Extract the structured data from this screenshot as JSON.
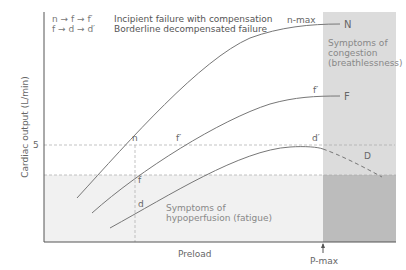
{
  "legend": {
    "items": [
      {
        "key": "n → f → f′",
        "description": "Incipient failure with compensation"
      },
      {
        "key": "f → d → d′",
        "description": "Borderline decompensated failure"
      }
    ]
  },
  "axes": {
    "y_label": "Cardiac output (L/min)",
    "y_tick": "5",
    "x_label": "Preload",
    "x_marker": "P-max"
  },
  "curves": {
    "normal": {
      "start_label": "n",
      "max_label": "n-max",
      "end_label": "N"
    },
    "failure": {
      "start_label": "f",
      "shift_label": "f′",
      "end_label": "F"
    },
    "decompensated": {
      "start_label": "d",
      "shift_label": "d′",
      "end_label": "D"
    }
  },
  "regions": {
    "congestion": "Symptoms of congestion (breathlessness)",
    "congestion_lines": [
      "Symptoms of",
      "congestion",
      "(breathlessness)"
    ],
    "hypoperfusion_lines": [
      "Symptoms of",
      "hypoperfusion (fatigue)"
    ]
  },
  "colors": {
    "congestion_panel": "#d9d9d9",
    "overlap_panel": "#b9b9b9",
    "hypoperfusion_area": "#f0f0f0",
    "curve": "#777777",
    "axis": "#555555"
  }
}
